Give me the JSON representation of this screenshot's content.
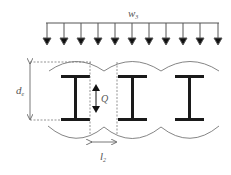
{
  "diagram": {
    "load_label": "w",
    "load_subscript": "3",
    "depth_label": "d",
    "depth_subscript": "e",
    "shear_label": "Q",
    "spacing_label": "l",
    "spacing_subscript": "2",
    "load_arrow_count": 11,
    "beam_count": 3,
    "colors": {
      "beam": "#1a1a1a",
      "line": "#555555",
      "arc": "#777777",
      "dashed": "#666666"
    }
  }
}
